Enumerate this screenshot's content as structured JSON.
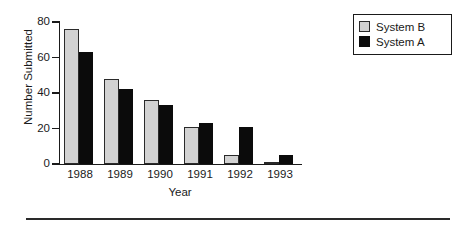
{
  "chart_data": {
    "type": "bar",
    "title": "",
    "xlabel": "Year",
    "ylabel": "Number Submitted",
    "categories": [
      "1988",
      "1989",
      "1990",
      "1991",
      "1992",
      "1993"
    ],
    "series": [
      {
        "name": "System B",
        "color": "#d2d2d2",
        "values": [
          76,
          48,
          36,
          21,
          5,
          0
        ]
      },
      {
        "name": "System A",
        "color": "#0b0b0b",
        "values": [
          63,
          42,
          33,
          23,
          21,
          5
        ]
      }
    ],
    "ylim": [
      0,
      80
    ],
    "yticks": [
      0,
      20,
      40,
      60,
      80
    ],
    "ytick_labels": [
      "0",
      "20",
      "40",
      "60",
      "80"
    ],
    "grid": false,
    "legend_position": "top-right"
  },
  "legend": {
    "entries": [
      {
        "label": "System B"
      },
      {
        "label": "System A"
      }
    ]
  },
  "axes": {
    "y_title": "Number Submitted",
    "x_title": "Year"
  }
}
